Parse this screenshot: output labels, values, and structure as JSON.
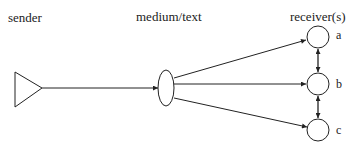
{
  "labels": {
    "sender": "sender",
    "medium": "medium/text",
    "receivers": "receiver(s)",
    "a": "a",
    "b": "b",
    "c": "c"
  },
  "colors": {
    "stroke": "#222222",
    "background": "#ffffff"
  }
}
